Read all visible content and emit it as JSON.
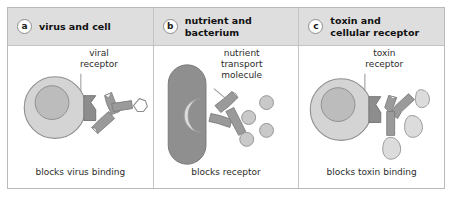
{
  "figure": {
    "panels": [
      {
        "letter": "a",
        "title": "virus and cell",
        "label": "viral\nreceptor",
        "caption": "blocks virus binding"
      },
      {
        "letter": "b",
        "title": "nutrient and\nbacterium",
        "label": "nutrient\ntransport\nmolecule",
        "caption": "blocks receptor"
      },
      {
        "letter": "c",
        "title": "toxin and\ncellular receptor",
        "label": "toxin\nreceptor",
        "caption": "blocks toxin binding"
      }
    ]
  },
  "colors": {
    "header_band": "#dedede",
    "frame_border": "#b9b9b9",
    "panel_divider": "#c3c3c3",
    "cell_body": "#d4d4d4",
    "cell_nucleus": "#bcbcbc",
    "cell_outline": "#8f8f8f",
    "receptor_dark": "#8d8d8d",
    "antibody": "#9a9a9a",
    "antibody_outline": "#7d7d7d",
    "bacterium": "#8f8f8f",
    "bacterium_receptor": "#d8d8d8",
    "nutrient_dot": "#c9c9c9",
    "toxin_drop": "#dcdcdc",
    "leader_line": "#a0a0a0",
    "text": "#2b2b2b"
  }
}
